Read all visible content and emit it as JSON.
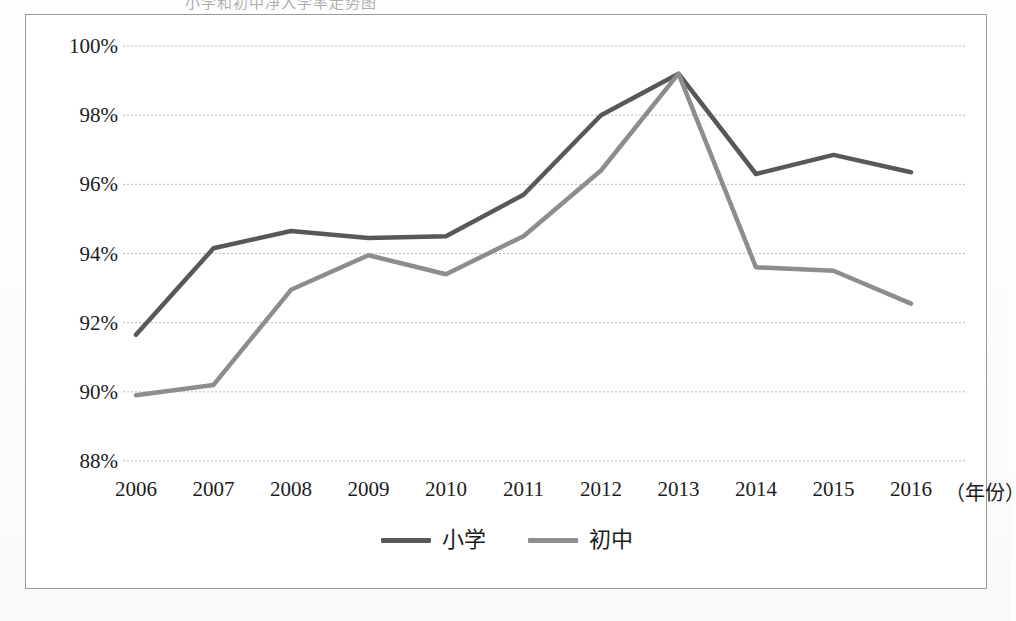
{
  "document": {
    "title_partial": "小学和初中净入学率走势图",
    "unit_label": "（年份）"
  },
  "chart_data": {
    "type": "line",
    "title": "",
    "xlabel": "（年份）",
    "ylabel": "",
    "categories": [
      "2006",
      "2007",
      "2008",
      "2009",
      "2010",
      "2011",
      "2012",
      "2013",
      "2014",
      "2015",
      "2016"
    ],
    "ylim": [
      88,
      100
    ],
    "ytick_values": [
      88,
      90,
      92,
      94,
      96,
      98,
      100
    ],
    "ytick_labels": [
      "88%",
      "90%",
      "92%",
      "94%",
      "96%",
      "98%",
      "100%"
    ],
    "grid": true,
    "legend_position": "bottom-center",
    "series": [
      {
        "name": "小学",
        "color": "#585858",
        "values": [
          91.65,
          94.15,
          94.65,
          94.45,
          94.5,
          95.7,
          98.0,
          99.2,
          96.3,
          96.85,
          96.35
        ]
      },
      {
        "name": "初中",
        "color": "#8d8d8d",
        "values": [
          89.9,
          90.2,
          92.95,
          93.95,
          93.4,
          94.5,
          96.4,
          99.2,
          93.6,
          93.5,
          92.55
        ]
      }
    ]
  },
  "colors": {
    "series_primary": "#585858",
    "series_secondary": "#8d8d8d",
    "gridline": "#b9b9b9",
    "frame_border": "#9a9a9a",
    "text": "#1c1c1c"
  }
}
